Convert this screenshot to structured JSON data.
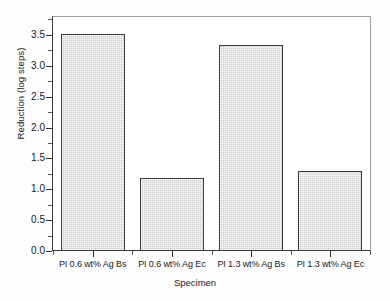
{
  "chart_data": {
    "type": "bar",
    "title": "",
    "xlabel": "Specimen",
    "ylabel": "Reduction (log steps)",
    "categories": [
      "PI 0.6 wt% Ag Bs",
      "PI 0.6 wt% Ag Ec",
      "PI 1.3 wt% Ag Bs",
      "PI 1.3 wt% Ag Ec"
    ],
    "values": [
      3.52,
      1.19,
      3.34,
      1.29
    ],
    "ylim": [
      0.0,
      3.79
    ],
    "ytick_labels": [
      "0.0",
      "0.5",
      "1.0",
      "1.5",
      "2.0",
      "2.5",
      "3.0",
      "3.5"
    ],
    "ytick_values": [
      0.0,
      0.5,
      1.0,
      1.5,
      2.0,
      2.5,
      3.0,
      3.5
    ],
    "yminor_values": [
      0.25,
      0.75,
      1.25,
      1.75,
      2.25,
      2.75,
      3.25,
      3.75
    ],
    "grid": false,
    "legend": false,
    "bar_fill_color": "#d6d6d6",
    "bar_edge_color": "#3b3b3b",
    "axis_color": "#333333",
    "background_color": "#ffffff"
  }
}
